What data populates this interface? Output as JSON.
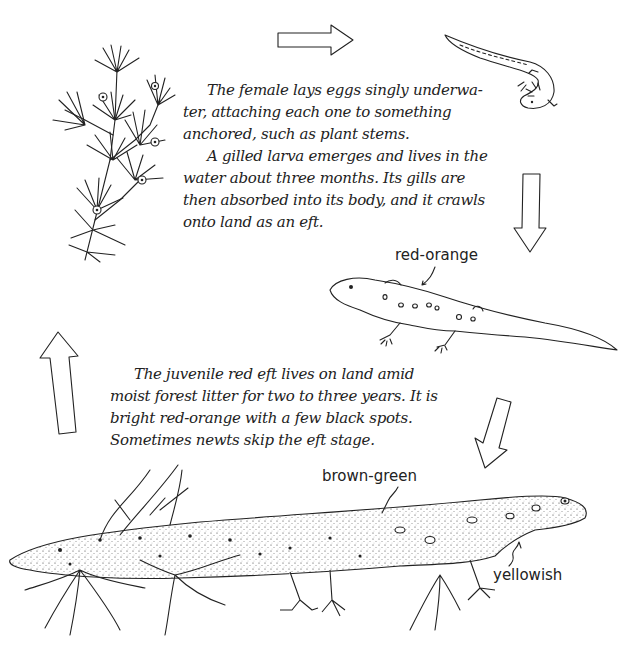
{
  "diagram": {
    "stages": [
      {
        "id": "egg",
        "depiction": "aquatic plant with eggs attached to stems"
      },
      {
        "id": "larva",
        "depiction": "gilled aquatic larva"
      },
      {
        "id": "eft",
        "depiction": "terrestrial red eft"
      },
      {
        "id": "adult",
        "depiction": "aquatic adult newt among plants"
      }
    ],
    "arrows": [
      {
        "id": "arrow-right-top",
        "from": "egg",
        "to": "larva",
        "direction": "right"
      },
      {
        "id": "arrow-down-right",
        "from": "larva",
        "to": "eft",
        "direction": "down"
      },
      {
        "id": "arrow-down-diagonal",
        "from": "eft",
        "to": "adult",
        "direction": "down-left"
      },
      {
        "id": "arrow-up-left",
        "from": "adult",
        "to": "egg",
        "direction": "up"
      }
    ],
    "text_block_1": {
      "lines": [
        "The female lays eggs singly underwa-",
        "ter, attaching each one to something",
        "anchored, such as plant stems.",
        "A gilled larva emerges and lives in the",
        "water about three months. Its gills are",
        "then absorbed into its body, and it crawls",
        "onto land as an eft."
      ]
    },
    "text_block_2": {
      "lines": [
        "The juvenile red eft lives on land amid",
        "moist forest litter for two to three years. It is",
        "bright red-orange with a few black spots.",
        "Sometimes newts skip the eft stage."
      ]
    },
    "labels": {
      "eft_color": "red-orange",
      "adult_back_color": "brown-green",
      "adult_belly_color": "yellowish"
    }
  }
}
